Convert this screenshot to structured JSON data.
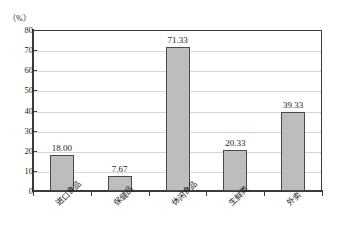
{
  "chart_data": {
    "type": "bar",
    "title": "",
    "subtitle": "",
    "xlabel": "",
    "ylabel": "（%）",
    "categories": [
      "进口食品",
      "保健品",
      "休闲食品",
      "生鲜类",
      "外卖"
    ],
    "values": [
      18.0,
      7.67,
      71.33,
      20.33,
      39.33
    ],
    "value_labels": [
      "18.00",
      "7.67",
      "71.33",
      "20.33",
      "39.33"
    ],
    "ylim": [
      0,
      80
    ],
    "ytick_values": [
      0,
      10,
      20,
      30,
      40,
      50,
      60,
      70,
      80
    ],
    "ytick_labels": [
      "0",
      "10",
      "20",
      "30",
      "40",
      "50",
      "60",
      "70",
      "80"
    ],
    "grid": true,
    "grid_axis": "y",
    "legend": false,
    "legend_position": "none",
    "bar_color": "#bdbdbd",
    "bar_border_color": "#4a4a4a",
    "gridline_color": "#d6d6d6",
    "axis_color": "#3a3a3a",
    "text_color": "#1c1c1c",
    "category_label_rotation": -45
  },
  "axis": {
    "unit_caption": "（%）"
  }
}
